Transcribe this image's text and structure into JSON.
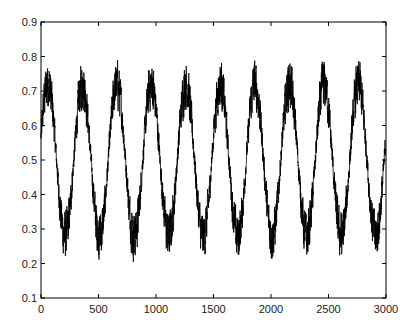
{
  "chart_data": {
    "type": "line",
    "title": "",
    "xlabel": "",
    "ylabel": "",
    "xlim": [
      0,
      3000
    ],
    "ylim": [
      0.1,
      0.9
    ],
    "grid": false,
    "legend": null,
    "xticks": [
      0,
      500,
      1000,
      1500,
      2000,
      2500,
      3000
    ],
    "xtick_labels": [
      "0",
      "500",
      "1000",
      "1500",
      "2000",
      "2500",
      "3000"
    ],
    "yticks": [
      0.1,
      0.2,
      0.3,
      0.4,
      0.5,
      0.6,
      0.7,
      0.8,
      0.9
    ],
    "ytick_labels": [
      "0.1",
      "0.2",
      "0.3",
      "0.4",
      "0.5",
      "0.6",
      "0.7",
      "0.8",
      "0.9"
    ],
    "series": [
      {
        "name": "signal",
        "color": "#000000",
        "n_points": 3000,
        "description": "Noisy sinusoid, period ~300 samples, mean ~0.5, amplitude ~0.22, noise +/-0.1",
        "model": {
          "mean": 0.5,
          "amplitude": 0.22,
          "period": 300,
          "phase_peak_at": 60,
          "noise": 0.1
        },
        "peaks_approx": [
          {
            "x": 60,
            "y": 0.85
          },
          {
            "x": 360,
            "y": 0.83
          },
          {
            "x": 660,
            "y": 0.84
          },
          {
            "x": 960,
            "y": 0.83
          },
          {
            "x": 1260,
            "y": 0.79
          },
          {
            "x": 1560,
            "y": 0.85
          },
          {
            "x": 1860,
            "y": 0.83
          },
          {
            "x": 2160,
            "y": 0.84
          },
          {
            "x": 2460,
            "y": 0.83
          },
          {
            "x": 2760,
            "y": 0.79
          }
        ],
        "troughs_approx": [
          {
            "x": 210,
            "y": 0.15
          },
          {
            "x": 510,
            "y": 0.16
          },
          {
            "x": 810,
            "y": 0.18
          },
          {
            "x": 1110,
            "y": 0.16
          },
          {
            "x": 1410,
            "y": 0.18
          },
          {
            "x": 1710,
            "y": 0.15
          },
          {
            "x": 2010,
            "y": 0.18
          },
          {
            "x": 2310,
            "y": 0.19
          },
          {
            "x": 2610,
            "y": 0.2
          },
          {
            "x": 2910,
            "y": 0.17
          }
        ]
      }
    ]
  }
}
